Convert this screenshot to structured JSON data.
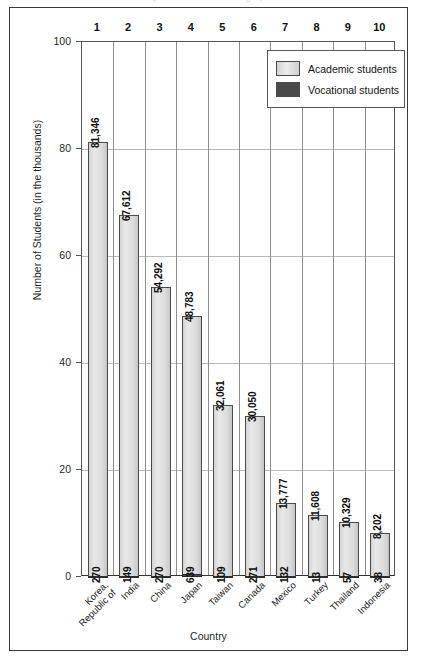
{
  "figure": {
    "clipped_title": "Top 10 Countries of Origin, 2008"
  },
  "legend": {
    "position": "top-right",
    "items": [
      {
        "label": "Academic students",
        "color": "#dcdcdc",
        "name": "academic"
      },
      {
        "label": "Vocational students",
        "color": "#4a4a4a",
        "name": "vocational"
      }
    ]
  },
  "chart_data": {
    "type": "bar",
    "title": "Top 10 Countries of Origin, 2008",
    "xlabel": "Country",
    "ylabel": "Number of Students (in the thousands)",
    "ylim": [
      0,
      100
    ],
    "yticks": [
      0,
      20,
      40,
      60,
      80,
      100
    ],
    "grid": true,
    "categories": [
      "Korea, Republic of",
      "India",
      "China",
      "Japan",
      "Taiwan",
      "Canada",
      "Mexico",
      "Turkey",
      "Thailand",
      "Indonesia"
    ],
    "ranks": [
      1,
      2,
      3,
      4,
      5,
      6,
      7,
      8,
      9,
      10
    ],
    "series": [
      {
        "name": "Academic students",
        "color": "#dcdcdc",
        "values": [
          81346,
          67612,
          54292,
          48783,
          32061,
          30050,
          13777,
          11608,
          10329,
          8202
        ],
        "labels": [
          "81,346",
          "67,612",
          "54,292",
          "48,783",
          "32,061",
          "30,050",
          "13,777",
          "11,608",
          "10,329",
          "8,202"
        ]
      },
      {
        "name": "Vocational students",
        "color": "#4a4a4a",
        "values": [
          270,
          149,
          270,
          639,
          109,
          271,
          132,
          13,
          57,
          38
        ],
        "labels": [
          "270",
          "149",
          "270",
          "639",
          "109",
          "271",
          "132",
          "13",
          "57",
          "38"
        ]
      }
    ]
  }
}
